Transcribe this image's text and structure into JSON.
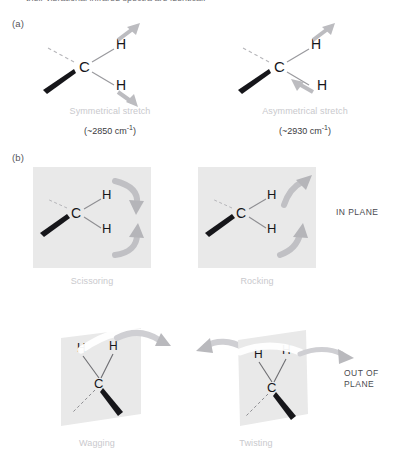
{
  "figure": {
    "top_partial_text": "their vibrational infrared spectra are identical.",
    "part_a_label": "(a)",
    "part_b_label": "(b)",
    "side_labels": {
      "in_plane": "IN PLANE",
      "out_of_plane": "OUT OF\nPLANE"
    }
  },
  "atoms": {
    "carbon": "C",
    "hydrogen": "H"
  },
  "modes": [
    {
      "id": "symmetrical-stretch",
      "caption": "Symmetrical stretch",
      "frequency_text": "(~2850 cm",
      "frequency_exponent": "-1",
      "frequency_close": ")",
      "group": "stretching",
      "arrow_description": "both H arrows point outward from carbon"
    },
    {
      "id": "asymmetrical-stretch",
      "caption": "Asymmetrical stretch",
      "frequency_text": "(~2930 cm",
      "frequency_exponent": "-1",
      "frequency_close": ")",
      "group": "stretching",
      "arrow_description": "upper H arrow points outward, lower H arrow points inward"
    },
    {
      "id": "scissoring",
      "caption": "Scissoring",
      "group": "in-plane-bending",
      "arrow_description": "curved arrows converge toward each other"
    },
    {
      "id": "rocking",
      "caption": "Rocking",
      "group": "in-plane-bending",
      "arrow_description": "curved arrows both sweep in same upward direction"
    },
    {
      "id": "wagging",
      "caption": "Wagging",
      "group": "out-of-plane-bending",
      "arrow_description": "both hydrogens move together out of the plane, single arrow to the right"
    },
    {
      "id": "twisting",
      "caption": "Twisting",
      "group": "out-of-plane-bending",
      "arrow_description": "hydrogens move in opposite out-of-plane directions, arrows point left and right"
    }
  ],
  "colors": {
    "panel_background": "#e9e9e9",
    "arrow_gray": "#b9b9bc",
    "arrow_gray_dark": "#a9a9ad",
    "bond_black": "#16161a",
    "bond_gray": "#9a9a9e",
    "caption_gray": "#c9c9cd",
    "text_dark": "#3a3a3e"
  }
}
